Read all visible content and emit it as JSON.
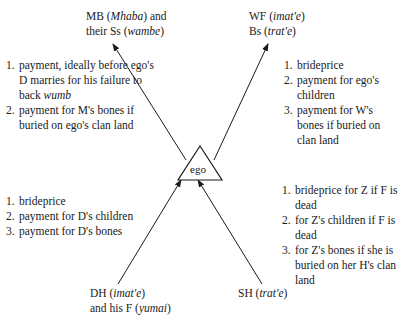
{
  "center": {
    "label": "ego"
  },
  "nodes": {
    "top_left": {
      "line1_pre": "MB (",
      "line1_term": "Mhaba",
      "line1_post": ") and",
      "line2_pre": "their Ss (",
      "line2_term": "wambe",
      "line2_post": ")"
    },
    "top_right": {
      "line1_pre": "WF (",
      "line1_term": "imat'e",
      "line1_post": ")",
      "line2_pre": "Bs (",
      "line2_term": "trat'e",
      "line2_post": ")"
    },
    "bottom_left": {
      "line1_pre": "DH (",
      "line1_term": "imat'e",
      "line1_post": ")",
      "line2_pre": "and his F (",
      "line2_term": "yumai",
      "line2_post": ")"
    },
    "bottom_right": {
      "line1_pre": "SH (",
      "line1_term": "trat'e",
      "line1_post": ")"
    }
  },
  "lists": {
    "top_left": [
      {
        "num": "1.",
        "text_pre": "payment, ideally before ego's D marries for his failure to back ",
        "text_term": "wumb"
      },
      {
        "num": "2.",
        "text_pre": "payment for M's bones if buried on ego's clan land",
        "text_term": ""
      }
    ],
    "top_right": [
      {
        "num": "1.",
        "text": "brideprice"
      },
      {
        "num": "2.",
        "text": "payment for ego's children"
      },
      {
        "num": "3.",
        "text": "payment for W's bones if buried on clan land"
      }
    ],
    "bottom_left": [
      {
        "num": "1.",
        "text": "brideprice"
      },
      {
        "num": "2.",
        "text": "payment for D's children"
      },
      {
        "num": "3.",
        "text": "payment for D's bones"
      }
    ],
    "bottom_right": [
      {
        "num": "1.",
        "text": "brideprice for Z if F is dead"
      },
      {
        "num": "2.",
        "text": "for Z's children if F is dead"
      },
      {
        "num": "3.",
        "text": "for Z's bones if she is buried on her H's clan land"
      }
    ]
  }
}
